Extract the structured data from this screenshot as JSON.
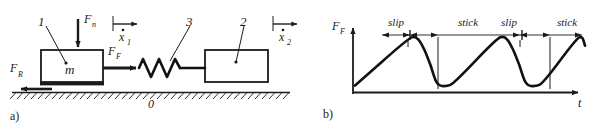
{
  "figure": {
    "panels": [
      {
        "id": "a",
        "label": "a)"
      },
      {
        "id": "b",
        "label": "b)"
      }
    ]
  },
  "panel_a": {
    "caption": "a)",
    "part_numbers": {
      "body_1": "1",
      "spring_3": "3",
      "body_2": "2",
      "ground_0": "0"
    },
    "mass_label": "m",
    "forces": {
      "normal": {
        "base": "F",
        "sub": "n"
      },
      "friction_drive": {
        "base": "F",
        "sub": "F"
      },
      "reaction": {
        "base": "F",
        "sub": "R"
      }
    },
    "velocities": {
      "v1": {
        "base": "x",
        "sub": "1",
        "dot": true
      },
      "v2": {
        "base": "x",
        "sub": "2",
        "dot": true
      }
    }
  },
  "panel_b": {
    "caption": "b)",
    "axis": {
      "y_label": {
        "base": "F",
        "sub": "F"
      },
      "x_label": "t"
    },
    "phase_labels": [
      "slip",
      "stick",
      "slip",
      "stick"
    ],
    "chart_data": {
      "type": "line",
      "title": "",
      "xlabel": "t",
      "ylabel": "F_F",
      "grid": false,
      "legend": null,
      "xlim": [
        0,
        1
      ],
      "ylim": [
        0,
        1
      ],
      "annotations": [
        {
          "text": "slip",
          "x_start": 0.235,
          "x_end": 0.355
        },
        {
          "text": "stick",
          "x_start": 0.355,
          "x_end": 0.62
        },
        {
          "text": "slip",
          "x_start": 0.62,
          "x_end": 0.74
        },
        {
          "text": "stick",
          "x_start": 0.74,
          "x_end": 1.0
        }
      ],
      "series": [
        {
          "name": "friction force",
          "comment": "stick-slip sawtooth: slow rise during stick, rapid concave decay during slip",
          "points": [
            [
              0.0,
              0.06
            ],
            [
              0.23,
              0.88
            ],
            [
              0.262,
              0.93
            ],
            [
              0.29,
              0.8
            ],
            [
              0.33,
              0.42
            ],
            [
              0.355,
              0.06
            ],
            [
              0.4,
              0.045
            ],
            [
              0.43,
              0.1
            ],
            [
              0.615,
              0.88
            ],
            [
              0.648,
              0.935
            ],
            [
              0.676,
              0.8
            ],
            [
              0.716,
              0.42
            ],
            [
              0.742,
              0.06
            ],
            [
              0.786,
              0.045
            ],
            [
              0.818,
              0.1
            ],
            [
              0.962,
              0.88
            ],
            [
              0.988,
              0.93
            ],
            [
              1.0,
              0.76
            ]
          ]
        }
      ]
    }
  }
}
